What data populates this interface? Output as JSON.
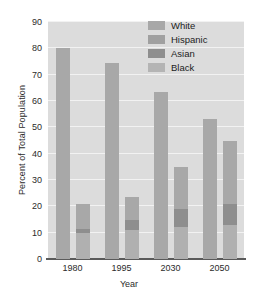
{
  "chart_data": {
    "type": "bar",
    "title": "",
    "xlabel": "Year",
    "ylabel": "Percent of Total Population",
    "categories": [
      "1980",
      "1995",
      "2030",
      "2050"
    ],
    "ylim": [
      0,
      90
    ],
    "yticks": [
      0,
      10,
      20,
      30,
      40,
      50,
      60,
      70,
      80,
      90
    ],
    "ytick_labels": [
      "0",
      "10",
      "20",
      "30",
      "40",
      "50",
      "60",
      "70",
      "80",
      "90"
    ],
    "grid": true,
    "legend_position": "top-right",
    "series": [
      {
        "name": "White",
        "color": "#a8a8a8",
        "values": [
          80.0,
          74.5,
          63.5,
          53.0
        ]
      },
      {
        "name": "Hispanic",
        "color": "#a8a8a8",
        "values": [
          9.5,
          8.5,
          16.0,
          24.0
        ]
      },
      {
        "name": "Asian",
        "color": "#8e8e8e",
        "values": [
          1.5,
          4.0,
          7.0,
          8.0
        ]
      },
      {
        "name": "Black",
        "color": "#b0b0b0",
        "values": [
          10.0,
          11.0,
          12.0,
          13.0
        ]
      }
    ],
    "stacked_bar_order": [
      "Black",
      "Asian",
      "Hispanic"
    ],
    "stacked_totals": [
      20.5,
      23.5,
      35.0,
      45.0
    ]
  },
  "legend": {
    "items": [
      {
        "label": "White",
        "color": "#a8a8a8"
      },
      {
        "label": "Hispanic",
        "color": "#a0a0a0"
      },
      {
        "label": "Asian",
        "color": "#8e8e8e"
      },
      {
        "label": "Black",
        "color": "#b4b4b4"
      }
    ]
  },
  "axes": {
    "x_title": "Year",
    "y_title": "Percent of Total Population"
  },
  "colors": {
    "plot_background": "#dcdcdc",
    "gridline": "#f2f2f2",
    "axis_line": "#5a5a5a",
    "text": "#2b2b2b"
  }
}
